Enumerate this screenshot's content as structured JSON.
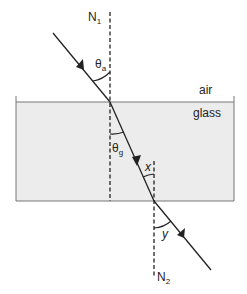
{
  "diagram": {
    "type": "refraction through glass block",
    "labels": {
      "normal_1": "N",
      "normal_1_sub": "1",
      "normal_2": "N",
      "normal_2_sub": "2",
      "angle_air": "θ",
      "angle_air_sub": "a",
      "angle_glass": "θ",
      "angle_glass_sub": "g",
      "angle_x": "x",
      "angle_y": "y",
      "medium_top": "air",
      "medium_block": "glass"
    },
    "colors": {
      "glass_fill": "#ececec",
      "line": "#222222",
      "block_border": "#777777"
    }
  }
}
